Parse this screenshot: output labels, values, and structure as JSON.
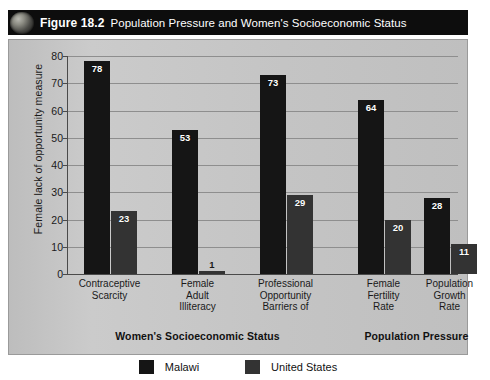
{
  "figure": {
    "number": "Figure 18.2",
    "title": "Population Pressure and Women's Socioeconomic Status",
    "icon": "globe-icon"
  },
  "chart_data": {
    "type": "bar",
    "title": "Population Pressure and Women's Socioeconomic Status",
    "xlabel": "",
    "ylabel": "Female lack of opportunity measure",
    "ylim": [
      0,
      80
    ],
    "yticks": [
      0,
      10,
      20,
      30,
      40,
      50,
      60,
      70,
      80
    ],
    "grid": true,
    "legend_position": "bottom",
    "categories": [
      "Contraceptive Scarcity",
      "Female Adult Illiteracy",
      "Professional Opportunity Barriers of",
      "Female Fertility Rate",
      "Population Growth Rate"
    ],
    "category_lines": [
      [
        "Contraceptive",
        "Scarcity"
      ],
      [
        "Female",
        "Adult",
        "Illiteracy"
      ],
      [
        "Professional",
        "Opportunity",
        "Barriers of"
      ],
      [
        "Female",
        "Fertility",
        "Rate"
      ],
      [
        "Population",
        "Growth",
        "Rate"
      ]
    ],
    "series": [
      {
        "name": "Malawi",
        "color": "#151515",
        "values": [
          78,
          53,
          73,
          64,
          28
        ]
      },
      {
        "name": "United States",
        "color": "#333333",
        "values": [
          23,
          1,
          29,
          20,
          11
        ]
      }
    ],
    "groups": [
      {
        "label": "Women's Socioeconomic Status",
        "categories": [
          0,
          1,
          2
        ]
      },
      {
        "label": "Population Pressure",
        "categories": [
          3,
          4
        ]
      }
    ]
  },
  "legend": [
    {
      "label": "Malawi",
      "color": "#151515"
    },
    {
      "label": "United States",
      "color": "#333333"
    }
  ],
  "colors": {
    "titlebar_bg": "#0d0d0d",
    "titlebar_text": "#ffffff",
    "panel_bg": "#c3c3c3",
    "gridline": "#8e8e8e",
    "axis": "#4a4a4a",
    "page_bg": "#ffffff"
  }
}
